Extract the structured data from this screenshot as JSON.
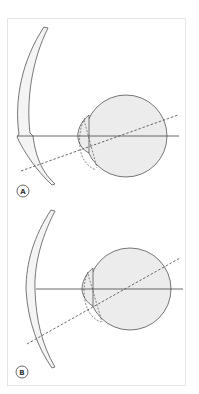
{
  "figure": {
    "colors": {
      "stroke": "#555555",
      "globe_fill": "#ececec",
      "lens_fill": "#f4f4f4",
      "frame_border": "#e6e6e6"
    },
    "panels": [
      {
        "label": "A",
        "lens": "lenticular lens with step at lower outer edge",
        "eye_center": [
          126,
          136
        ],
        "eye_radius": 41
      },
      {
        "label": "B",
        "lens": "meniscus lens without step",
        "eye_center": [
          130,
          289
        ],
        "eye_radius": 41
      }
    ]
  }
}
